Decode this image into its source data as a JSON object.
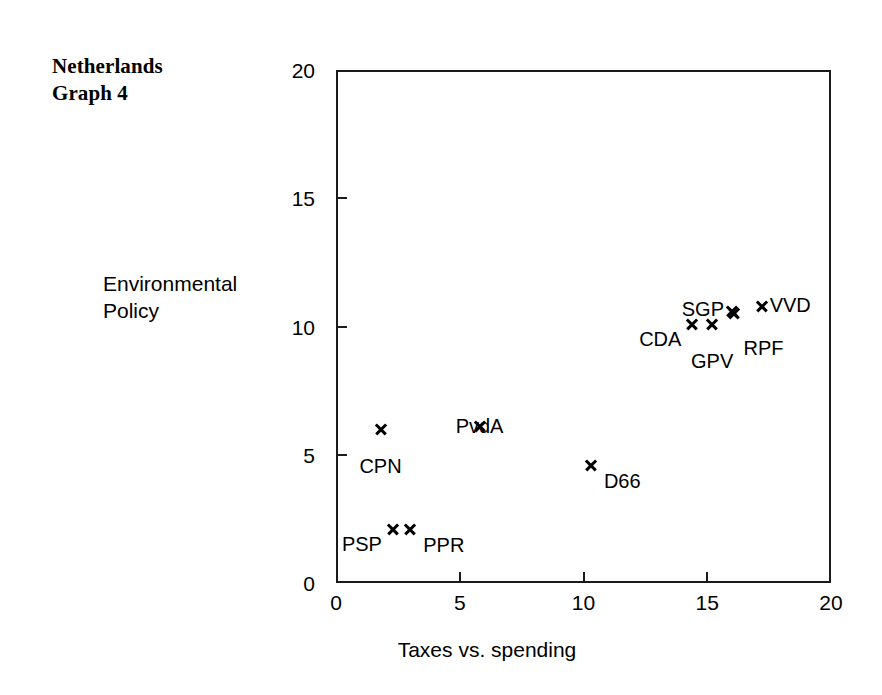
{
  "figure": {
    "title": "Netherlands\nGraph 4",
    "background_color": "#ffffff",
    "ink_color": "#000000"
  },
  "chart_data": {
    "type": "scatter",
    "title": "Netherlands Graph 4",
    "xlabel": "Taxes vs. spending",
    "ylabel": "Environmental\nPolicy",
    "ylabel_line1": "Environmental",
    "ylabel_line2": "Policy",
    "xlim": [
      0,
      20
    ],
    "ylim": [
      0,
      20
    ],
    "xticks": [
      0,
      5,
      10,
      15,
      20
    ],
    "yticks": [
      0,
      5,
      10,
      15,
      20
    ],
    "xticklabels": [
      "0",
      "5",
      "10",
      "15",
      "20"
    ],
    "yticklabels": [
      "0",
      "5",
      "10",
      "15",
      "20"
    ],
    "grid": false,
    "legend": false,
    "marker": "x",
    "points": [
      {
        "label": "PSP",
        "x": 2.3,
        "y": 2.1,
        "label_pos": "left"
      },
      {
        "label": "PPR",
        "x": 3.0,
        "y": 2.1,
        "label_pos": "right"
      },
      {
        "label": "CPN",
        "x": 1.8,
        "y": 6.0,
        "label_pos": "below"
      },
      {
        "label": "PvdA",
        "x": 5.8,
        "y": 6.1,
        "label_pos": "above"
      },
      {
        "label": "D66",
        "x": 10.3,
        "y": 4.6,
        "label_pos": "right"
      },
      {
        "label": "CDA",
        "x": 14.4,
        "y": 10.1,
        "label_pos": "left"
      },
      {
        "label": "GPV",
        "x": 15.2,
        "y": 10.1,
        "label_pos": "below"
      },
      {
        "label": "SGP",
        "x": 16.0,
        "y": 10.6,
        "label_pos": "above-left"
      },
      {
        "label": "RPF",
        "x": 16.1,
        "y": 10.5,
        "label_pos": "below-right"
      },
      {
        "label": "VVD",
        "x": 17.2,
        "y": 10.8,
        "label_pos": "above-right"
      }
    ]
  }
}
